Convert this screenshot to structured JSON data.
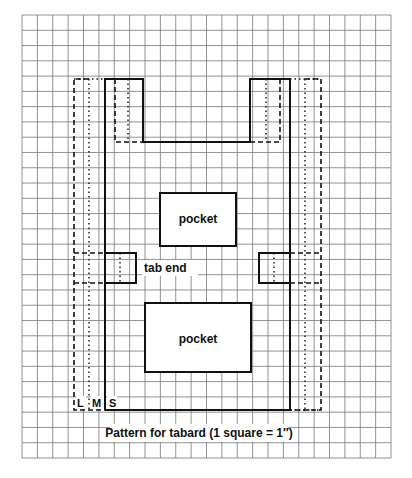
{
  "diagram": {
    "caption": "Pattern for tabard (1 square = 1″)",
    "labels": {
      "pocket_top": "pocket",
      "pocket_bottom": "pocket",
      "tab_end": "tab end",
      "size_l": "L",
      "size_m": "M",
      "size_s": "S"
    },
    "grid": {
      "columns": 24,
      "rows": 29,
      "unit": "1 square = 1 inch"
    },
    "sizes": [
      {
        "name": "S",
        "line_style": "solid"
      },
      {
        "name": "M",
        "line_style": "dotted"
      },
      {
        "name": "L",
        "line_style": "dashed"
      }
    ],
    "colors": {
      "grid": "#555555",
      "ink": "#111111",
      "background": "#ffffff"
    }
  }
}
